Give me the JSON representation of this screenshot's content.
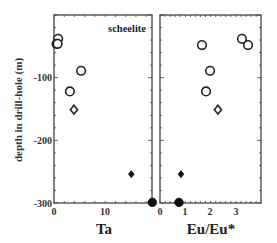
{
  "chart_data": [
    {
      "type": "scatter",
      "panel": "left",
      "title": "",
      "annotation": "scheelite",
      "xlabel": "Ta",
      "ylabel": "depth in drill-hole (m)",
      "xlim": [
        0,
        19
      ],
      "ylim": [
        -300,
        0
      ],
      "xticks": [
        0,
        10
      ],
      "yticks": [
        -100,
        -200,
        -300
      ],
      "grid": false,
      "series": [
        {
          "name": "open circles",
          "marker": "circle",
          "fill": "open",
          "points": [
            {
              "x": 0.8,
              "y": -38
            },
            {
              "x": 0.5,
              "y": -46
            },
            {
              "x": 0.7,
              "y": -46
            },
            {
              "x": 5.3,
              "y": -89
            },
            {
              "x": 3.1,
              "y": -122
            }
          ]
        },
        {
          "name": "open diamonds",
          "marker": "diamond",
          "fill": "open",
          "points": [
            {
              "x": 3.9,
              "y": -151
            }
          ]
        },
        {
          "name": "filled diamonds",
          "marker": "diamond",
          "fill": "filled",
          "points": [
            {
              "x": 15.1,
              "y": -254
            }
          ]
        },
        {
          "name": "filled circles",
          "marker": "circle",
          "fill": "filled",
          "points": [
            {
              "x": 19.2,
              "y": -299
            }
          ]
        }
      ]
    },
    {
      "type": "scatter",
      "panel": "right",
      "title": "",
      "xlabel": "Eu/Eu*",
      "ylabel": "",
      "xlim": [
        0,
        4
      ],
      "ylim": [
        -300,
        0
      ],
      "xticks": [
        0,
        1,
        2,
        3
      ],
      "yticks": [],
      "grid": false,
      "series": [
        {
          "name": "open circles",
          "marker": "circle",
          "fill": "open",
          "points": [
            {
              "x": 3.24,
              "y": -38
            },
            {
              "x": 1.66,
              "y": -48
            },
            {
              "x": 3.48,
              "y": -48
            },
            {
              "x": 1.98,
              "y": -89
            },
            {
              "x": 1.82,
              "y": -122
            }
          ]
        },
        {
          "name": "open diamonds",
          "marker": "diamond",
          "fill": "open",
          "points": [
            {
              "x": 2.29,
              "y": -151
            }
          ]
        },
        {
          "name": "filled diamonds",
          "marker": "diamond",
          "fill": "filled",
          "points": [
            {
              "x": 0.83,
              "y": -254
            }
          ]
        },
        {
          "name": "filled circles",
          "marker": "circle",
          "fill": "filled",
          "points": [
            {
              "x": 0.75,
              "y": -299
            }
          ]
        }
      ]
    }
  ],
  "labels": {
    "annotation": "scheelite",
    "ylabel": "depth in drill-hole (m)",
    "left_xlabel": "Ta",
    "right_xlabel": "Eu/Eu*",
    "left_xticks": [
      "0",
      "10"
    ],
    "right_xticks": [
      "0",
      "1",
      "2",
      "3"
    ],
    "yticks": [
      "-100",
      "-200",
      "-300"
    ]
  }
}
